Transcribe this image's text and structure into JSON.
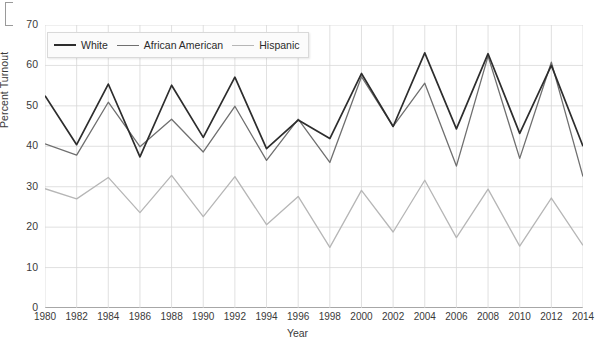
{
  "chart_data": {
    "type": "line",
    "title": "",
    "xlabel": "Year",
    "ylabel": "Percent Turnout",
    "xlim": [
      1980,
      2014
    ],
    "ylim": [
      0,
      70
    ],
    "ytick_step": 10,
    "xtick_step": 2,
    "grid": true,
    "legend_position": "top-left-inside",
    "x": [
      1980,
      1982,
      1984,
      1986,
      1988,
      1990,
      1992,
      1994,
      1996,
      1998,
      2000,
      2002,
      2004,
      2006,
      2008,
      2010,
      2012,
      2014
    ],
    "xticklabels": [
      "1980",
      "1982",
      "1984",
      "1986",
      "1988",
      "1990",
      "1992",
      "1994",
      "1996",
      "1998",
      "2000",
      "2002",
      "2004",
      "2006",
      "2008",
      "2010",
      "2012",
      "2014"
    ],
    "yticklabels": [
      "0",
      "10",
      "20",
      "30",
      "40",
      "50",
      "60",
      "70"
    ],
    "series": [
      {
        "name": "White",
        "color": "#2d2d2d",
        "values": [
          52.5,
          40.4,
          55.4,
          37.4,
          55.1,
          42.2,
          57.1,
          39.4,
          46.5,
          41.9,
          58.0,
          44.9,
          63.1,
          44.3,
          62.9,
          43.2,
          60.0,
          40.0
        ]
      },
      {
        "name": "African American",
        "color": "#6f6f6f",
        "values": [
          40.6,
          37.8,
          50.9,
          39.9,
          46.7,
          38.6,
          49.9,
          36.5,
          46.7,
          36.0,
          57.2,
          44.9,
          55.6,
          35.1,
          62.3,
          37.0,
          60.8,
          32.5
        ]
      },
      {
        "name": "Hispanic",
        "color": "#b6b6b6",
        "values": [
          29.5,
          27.0,
          32.3,
          23.6,
          32.8,
          22.6,
          32.5,
          20.6,
          27.6,
          15.0,
          29.1,
          18.8,
          31.6,
          17.4,
          29.4,
          15.3,
          27.2,
          15.5
        ]
      }
    ]
  },
  "axes": {
    "ylabel": "Percent Turnout",
    "xlabel": "Year"
  },
  "legend": {
    "items": [
      {
        "label": "White"
      },
      {
        "label": "African American"
      },
      {
        "label": "Hispanic"
      }
    ]
  }
}
